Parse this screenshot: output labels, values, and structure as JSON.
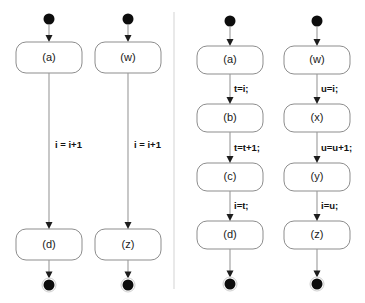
{
  "diagram": {
    "background_color": "#ffffff",
    "divider": {
      "name": "panel-divider",
      "x": 174,
      "y1": 12,
      "y2": 289,
      "color": "#d3d3d3"
    },
    "style": {
      "node_fill": "#ffffff",
      "node_stroke": "#8d8d8d",
      "edge_color": "#9a9a9a",
      "arrowhead_color": "#1d1d1d",
      "initial_node_color": "#0d0d0d",
      "final_node_color": "#0d0d0d",
      "label_color": "#121212"
    },
    "node_shape": "rounded-rectangle",
    "initial_node_glyph": "filled-circle",
    "final_node_glyph": "bullseye-circle",
    "panels": [
      {
        "name": "left-panel",
        "columns": [
          {
            "name": "column-a-d",
            "center_x": 49,
            "nodes": [
              {
                "label": "(a)",
                "y": 42,
                "height": 31
              },
              {
                "label": "(d)",
                "y": 229,
                "height": 31
              }
            ],
            "edges": [
              {
                "label": "i = i+1",
                "label_x": 55,
                "label_y": 145
              }
            ],
            "initial_y": 19,
            "final_y": 285
          },
          {
            "name": "column-w-z",
            "center_x": 128,
            "nodes": [
              {
                "label": "(w)",
                "y": 42,
                "height": 31
              },
              {
                "label": "(z)",
                "y": 229,
                "height": 31
              }
            ],
            "edges": [
              {
                "label": "i = i+1",
                "label_x": 134,
                "label_y": 145
              }
            ],
            "initial_y": 19,
            "final_y": 285
          }
        ]
      },
      {
        "name": "right-panel",
        "columns": [
          {
            "name": "column-a-b-c-d",
            "center_x": 230,
            "nodes": [
              {
                "label": "(a)",
                "y": 46,
                "height": 28
              },
              {
                "label": "(b)",
                "y": 104,
                "height": 28
              },
              {
                "label": "(c)",
                "y": 163,
                "height": 28
              },
              {
                "label": "(d)",
                "y": 221,
                "height": 28
              }
            ],
            "edges": [
              {
                "label": "t=i;",
                "label_x": 234,
                "label_y": 89
              },
              {
                "label": "t=t+1;",
                "label_x": 234,
                "label_y": 148
              },
              {
                "label": "i=t;",
                "label_x": 234,
                "label_y": 206
              }
            ],
            "initial_y": 21,
            "final_y": 284
          },
          {
            "name": "column-w-x-y-z",
            "center_x": 317,
            "nodes": [
              {
                "label": "(w)",
                "y": 46,
                "height": 28
              },
              {
                "label": "(x)",
                "y": 104,
                "height": 28
              },
              {
                "label": "(y)",
                "y": 163,
                "height": 28
              },
              {
                "label": "(z)",
                "y": 221,
                "height": 28
              }
            ],
            "edges": [
              {
                "label": "u=i;",
                "label_x": 321,
                "label_y": 89
              },
              {
                "label": "u=u+1;",
                "label_x": 321,
                "label_y": 148
              },
              {
                "label": "i=u;",
                "label_x": 321,
                "label_y": 206
              }
            ],
            "initial_y": 21,
            "final_y": 284
          }
        ]
      }
    ]
  }
}
